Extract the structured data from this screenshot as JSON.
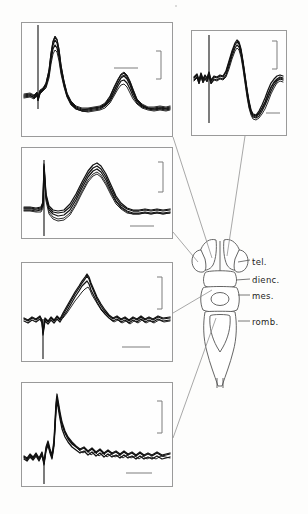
{
  "figure": {
    "background_color": "#fdfdfc",
    "trace_color": "#111111",
    "outline_color": "#555555",
    "leader_color": "#8b8b8b",
    "panel_border_color": "#9a9a9a"
  },
  "brain_diagram": {
    "name": "dorsal-view-brain-schematic",
    "orientation": "dorsal view, rostral at top",
    "labels": [
      {
        "id": "tel",
        "text": "tel.",
        "region": "telencephalon"
      },
      {
        "id": "dienc",
        "text": "dienc.",
        "region": "diencephalon"
      },
      {
        "id": "mes",
        "text": "mes.",
        "region": "mesencephalon"
      },
      {
        "id": "romb",
        "text": "romb.",
        "region": "rhombencephalon"
      }
    ]
  },
  "panels": [
    {
      "id": "panel-telencephalon",
      "position": "top-left",
      "linked_region": "tel.",
      "waveform": "stimulus artifact followed by a large sharp positive peak and a later second broader peak",
      "sweeps": 5,
      "has_vertical_calibration_bar": true,
      "has_horizontal_calibration_bar": true
    },
    {
      "id": "panel-diencephalon-right",
      "position": "top-right",
      "linked_region": "dienc.",
      "waveform": "biphasic response: upward peak followed by deep negative trough and slow recovery",
      "sweeps": 5,
      "has_vertical_calibration_bar": true,
      "has_horizontal_calibration_bar": true
    },
    {
      "id": "panel-diencephalon-left",
      "position": "second-left",
      "linked_region": "dienc.",
      "waveform": "stimulus artifact then a single broad symmetric positive wave",
      "sweeps": 5,
      "has_vertical_calibration_bar": true,
      "has_horizontal_calibration_bar": true
    },
    {
      "id": "panel-mesencephalon",
      "position": "third-left",
      "linked_region": "mes.",
      "waveform": "noisy baseline with a slow triangular positive peak",
      "sweeps": 4,
      "has_vertical_calibration_bar": true,
      "has_horizontal_calibration_bar": true
    },
    {
      "id": "panel-rhombencephalon",
      "position": "bottom-left",
      "linked_region": "romb.",
      "waveform": "fast sharp spike followed by exponential decay into noisy baseline",
      "sweeps": 5,
      "has_vertical_calibration_bar": true,
      "has_horizontal_calibration_bar": true
    }
  ]
}
